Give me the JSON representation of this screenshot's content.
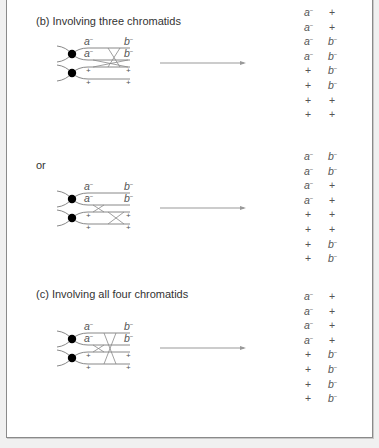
{
  "panels": [
    {
      "heading": "(b) Involving three chromatids",
      "top": 48,
      "labels": {
        "a1": "a",
        "a2": "a",
        "b1": "b",
        "b2": "b",
        "p1": "+",
        "p2": "+",
        "p3": "+",
        "p4": "+"
      },
      "crossovers": [
        [
          93,
          128,
          2,
          3
        ],
        [
          108,
          120,
          1,
          3
        ]
      ],
      "genotypes": [
        [
          "a-",
          "+"
        ],
        [
          "a-",
          "+"
        ],
        [
          "a-",
          "b-"
        ],
        [
          "a-",
          "b-"
        ],
        [
          "+",
          "b-"
        ],
        [
          "+",
          "b-"
        ],
        [
          "+",
          "+"
        ],
        [
          "+",
          "+"
        ]
      ]
    },
    {
      "heading": "or",
      "top": 193,
      "labels": {
        "a1": "a",
        "a2": "a",
        "b1": "b",
        "b2": "b",
        "p1": "+",
        "p2": "+",
        "p3": "+",
        "p4": "+"
      },
      "crossovers": [
        [
          93,
          104,
          2,
          3
        ],
        [
          108,
          124,
          3,
          4
        ]
      ],
      "genotypes": [
        [
          "a-",
          "b-"
        ],
        [
          "a-",
          "b-"
        ],
        [
          "a-",
          "+"
        ],
        [
          "a-",
          "+"
        ],
        [
          "+",
          "+"
        ],
        [
          "+",
          "+"
        ],
        [
          "+",
          "b-"
        ],
        [
          "+",
          "b-"
        ]
      ]
    },
    {
      "heading": "(c) Involving all four chromatids",
      "top": 333,
      "labels": {
        "a1": "a",
        "a2": "a",
        "b1": "b",
        "b2": "b",
        "p1": "+",
        "p2": "+",
        "p3": "+",
        "p4": "+"
      },
      "crossovers": [
        [
          93,
          104,
          2,
          3
        ],
        [
          104,
          116,
          1,
          4
        ]
      ],
      "genotypes": [
        [
          "a-",
          "+"
        ],
        [
          "a-",
          "+"
        ],
        [
          "a-",
          "+"
        ],
        [
          "a-",
          "+"
        ],
        [
          "+",
          "b-"
        ],
        [
          "+",
          "b-"
        ],
        [
          "+",
          "b-"
        ],
        [
          "+",
          "b-"
        ]
      ]
    }
  ],
  "minus_sign": "−",
  "colors": {
    "line": "#888888",
    "centromere": "#000000",
    "text": "#444444"
  }
}
